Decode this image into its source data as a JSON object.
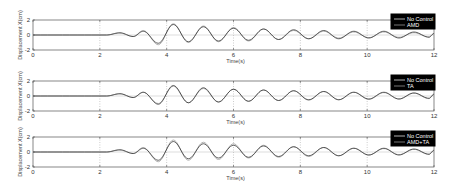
{
  "figure": {
    "panels": [
      {
        "ylabel": "Displacement X(cm)",
        "xlabel": "Time(s)",
        "legend": [
          "No Control",
          "AMD"
        ]
      },
      {
        "ylabel": "Displacement X(cm)",
        "xlabel": "Time(s)",
        "legend": [
          "No Control",
          "TA"
        ]
      },
      {
        "ylabel": "Displacement X(cm)",
        "xlabel": "Time(s)",
        "legend": [
          "No Control",
          "AMD+TA"
        ]
      }
    ],
    "xticks": [
      "0",
      "2",
      "4",
      "6",
      "8",
      "10",
      "12"
    ],
    "yticks": [
      "2",
      "0",
      "-2"
    ]
  },
  "chart_data": [
    {
      "type": "line",
      "title": "",
      "xlabel": "Time(s)",
      "ylabel": "Displacement X(cm)",
      "xlim": [
        0,
        12
      ],
      "ylim": [
        -2,
        2
      ],
      "grid": "vertical dotted at x ticks",
      "legend_position": "top-right (black box)",
      "series": [
        {
          "name": "No Control",
          "color": "#222222",
          "x": [
            0,
            2.2,
            2.6,
            3.0,
            3.3,
            3.75,
            4.2,
            4.65,
            5.1,
            5.55,
            6.0,
            6.45,
            6.9,
            7.35,
            7.8,
            8.25,
            8.7,
            9.15,
            9.6,
            10.05,
            10.5,
            10.95,
            11.4,
            11.85,
            12
          ],
          "y": [
            0,
            0,
            0.3,
            -0.2,
            0.5,
            -1.1,
            1.4,
            -0.9,
            1.1,
            -0.8,
            0.9,
            -0.7,
            0.8,
            -0.6,
            0.7,
            -0.5,
            0.6,
            -0.5,
            0.5,
            -0.4,
            0.5,
            -0.4,
            0.4,
            -0.3,
            0.2
          ]
        },
        {
          "name": "AMD",
          "color": "#aaaaaa",
          "x": [
            0,
            2.2,
            2.6,
            3.0,
            3.3,
            3.75,
            4.2,
            4.65,
            5.1,
            5.55,
            6.0,
            6.45,
            6.9,
            7.35,
            7.8,
            8.25,
            8.7,
            9.15,
            9.6,
            10.05,
            10.5,
            10.95,
            11.4,
            11.85,
            12
          ],
          "y": [
            0,
            0,
            0.25,
            -0.2,
            0.6,
            -1.3,
            1.5,
            -1.0,
            1.2,
            -0.9,
            1.0,
            -0.8,
            0.8,
            -0.6,
            0.6,
            -0.5,
            0.5,
            -0.4,
            0.4,
            -0.35,
            0.4,
            -0.3,
            0.3,
            -0.25,
            0.2
          ]
        }
      ]
    },
    {
      "type": "line",
      "title": "",
      "xlabel": "Time(s)",
      "ylabel": "Displacement X(cm)",
      "xlim": [
        0,
        12
      ],
      "ylim": [
        -2,
        2
      ],
      "grid": "vertical dotted at x ticks",
      "legend_position": "top-right (black box)",
      "series": [
        {
          "name": "No Control",
          "color": "#222222",
          "x": [
            0,
            2.2,
            2.6,
            3.0,
            3.3,
            3.75,
            4.2,
            4.65,
            5.1,
            5.55,
            6.0,
            6.45,
            6.9,
            7.35,
            7.8,
            8.25,
            8.7,
            9.15,
            9.6,
            10.05,
            10.5,
            10.95,
            11.4,
            11.85,
            12
          ],
          "y": [
            0,
            0,
            0.3,
            -0.2,
            0.5,
            -1.1,
            1.4,
            -0.9,
            1.1,
            -0.8,
            0.9,
            -0.7,
            0.8,
            -0.6,
            0.7,
            -0.5,
            0.6,
            -0.5,
            0.5,
            -0.4,
            0.5,
            -0.4,
            0.4,
            -0.3,
            0.2
          ]
        },
        {
          "name": "TA",
          "color": "#aaaaaa",
          "x": [
            0,
            2.2,
            2.6,
            3.0,
            3.3,
            3.75,
            4.2,
            4.65,
            5.1,
            5.55,
            6.0,
            6.45,
            6.9,
            7.35,
            7.8,
            8.25,
            8.7,
            9.15,
            9.6,
            10.05,
            10.5,
            10.95,
            11.4,
            11.85,
            12
          ],
          "y": [
            0,
            0,
            0.3,
            -0.2,
            0.5,
            -1.0,
            1.3,
            -0.9,
            1.0,
            -0.8,
            0.9,
            -0.7,
            0.8,
            -0.6,
            0.7,
            -0.55,
            0.6,
            -0.5,
            0.5,
            -0.45,
            0.45,
            -0.4,
            0.4,
            -0.35,
            0.3
          ]
        }
      ]
    },
    {
      "type": "line",
      "title": "",
      "xlabel": "Time(s)",
      "ylabel": "Displacement X(cm)",
      "xlim": [
        0,
        12
      ],
      "ylim": [
        -2,
        2
      ],
      "grid": "vertical dotted at x ticks",
      "legend_position": "top-right (black box)",
      "series": [
        {
          "name": "No Control",
          "color": "#222222",
          "x": [
            0,
            2.2,
            2.6,
            3.0,
            3.3,
            3.75,
            4.2,
            4.65,
            5.1,
            5.55,
            6.0,
            6.45,
            6.9,
            7.35,
            7.8,
            8.25,
            8.7,
            9.15,
            9.6,
            10.05,
            10.5,
            10.95,
            11.4,
            11.85,
            12
          ],
          "y": [
            0,
            0,
            0.3,
            -0.2,
            0.5,
            -1.1,
            1.4,
            -0.9,
            1.1,
            -0.8,
            0.9,
            -0.7,
            0.8,
            -0.6,
            0.7,
            -0.5,
            0.6,
            -0.5,
            0.5,
            -0.4,
            0.5,
            -0.4,
            0.4,
            -0.3,
            0.2
          ]
        },
        {
          "name": "AMD+TA",
          "color": "#aaaaaa",
          "x": [
            0,
            2.2,
            2.6,
            3.0,
            3.3,
            3.75,
            4.2,
            4.65,
            5.1,
            5.55,
            6.0,
            6.45,
            6.9,
            7.35,
            7.8,
            8.25,
            8.7,
            9.15,
            9.6,
            10.05,
            10.5,
            10.95,
            11.4,
            11.85,
            12
          ],
          "y": [
            0,
            0,
            0.25,
            -0.2,
            0.6,
            -1.3,
            1.6,
            -1.1,
            1.3,
            -1.0,
            1.1,
            -0.8,
            0.9,
            -0.7,
            0.7,
            -0.6,
            0.6,
            -0.5,
            0.5,
            -0.4,
            0.45,
            -0.35,
            0.35,
            -0.3,
            0.25
          ]
        }
      ]
    }
  ]
}
